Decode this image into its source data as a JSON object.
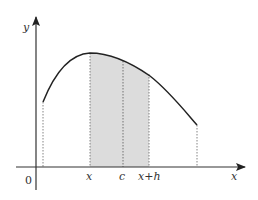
{
  "figure": {
    "type": "area-under-curve",
    "axes": {
      "x_label": "x",
      "y_label": "y",
      "origin_label": "0"
    },
    "tick_labels": [
      "x",
      "c",
      "x+h"
    ],
    "shaded_region": {
      "from": "x",
      "to": "x+h",
      "marker": "c"
    },
    "colors": {
      "curve": "#222222",
      "axis": "#333333",
      "shade": "#d9d9d9",
      "dotted": "#555555"
    }
  }
}
